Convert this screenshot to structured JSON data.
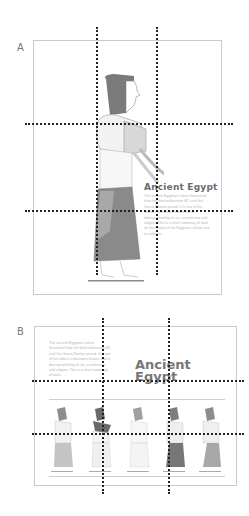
{
  "panels": [
    {
      "label": "A",
      "title": "Ancient Egypt",
      "body": "The ancient Egyptian culture flourished from the third millennium BC until the Greco-Roman period. It is one of the oldest civilizations known and is distinguished by its art, architecture and religion. This is a short summary of work on the history of the Egyptian culture and its artifacts.",
      "figure": {
        "name": "egyptian-figure",
        "hair_color": "#7a7a7a",
        "skirt_color": "#8a8a8a"
      }
    },
    {
      "label": "B",
      "title_line1": "Ancient",
      "title_line2": "Egypt",
      "body": "The ancient Egyptian culture flourished from the third millennium BC until the Greco-Roman period. It is one of the oldest civilizations known and is distinguished by its art, architecture and religion. This is a short summary of work.",
      "figures": [
        {
          "hair": "#8d8d8d",
          "skirt": "#c4c4c4"
        },
        {
          "hair": "#6a6a6a",
          "skirt": "#f0f0f0"
        },
        {
          "hair": "#a0a0a0",
          "skirt": "#f4f4f4"
        },
        {
          "hair": "#7d7d7d",
          "skirt": "#777777"
        },
        {
          "hair": "#8d8d8d",
          "skirt": "#a8a8a8"
        }
      ]
    }
  ],
  "grid_guides": {
    "style": "dotted",
    "color": "#222222"
  }
}
